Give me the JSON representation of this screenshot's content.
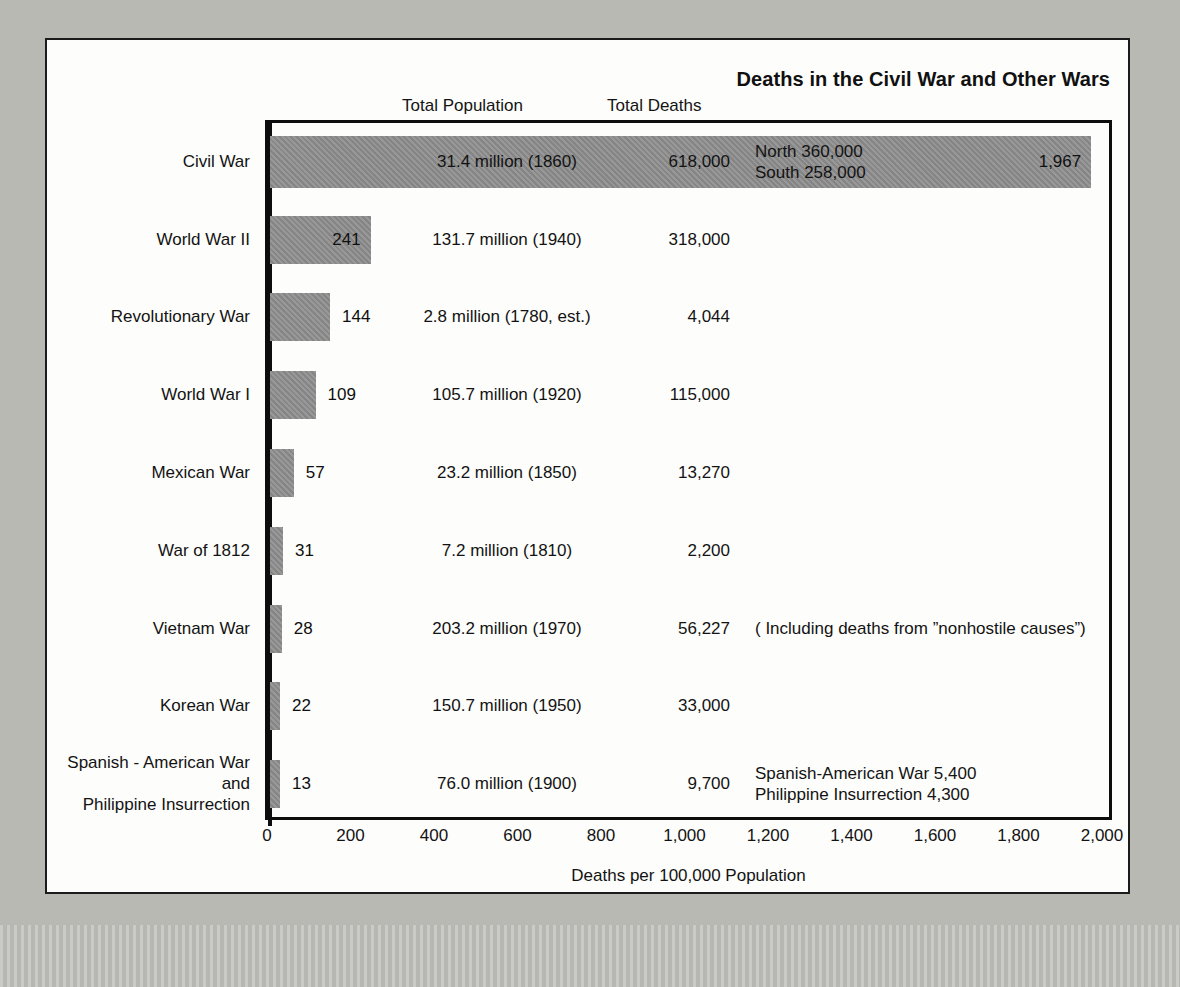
{
  "figure": {
    "title": "Deaths in the Civil War and Other Wars",
    "column_headers": {
      "population": "Total Population",
      "deaths": "Total Deaths"
    },
    "x_axis_title": "Deaths per 100,000 Population"
  },
  "chart_data": {
    "type": "bar",
    "orientation": "horizontal",
    "title": "Deaths in the Civil War and Other Wars",
    "xlabel": "Deaths per 100,000 Population",
    "ylabel": "",
    "xlim": [
      0,
      2000
    ],
    "grid": false,
    "legend": "none",
    "tick_labels": [
      "0",
      "200",
      "400",
      "600",
      "800",
      "1,000",
      "1,200",
      "1,400",
      "1,600",
      "1,800",
      "2,000"
    ],
    "tick_values": [
      0,
      200,
      400,
      600,
      800,
      1000,
      1200,
      1400,
      1600,
      1800,
      2000
    ],
    "categories": [
      "Civil War",
      "World War II",
      "Revolutionary War",
      "World War I",
      "Mexican War",
      "War of 1812",
      "Vietnam War",
      "Korean War",
      "Spanish - American War\nand\nPhilippine Insurrection"
    ],
    "values": [
      1967,
      241,
      144,
      109,
      57,
      31,
      28,
      22,
      13
    ],
    "value_labels": [
      "1,967",
      "241",
      "144",
      "109",
      "57",
      "31",
      "28",
      "22",
      "13"
    ],
    "rows": [
      {
        "category": "Civil War",
        "rate": 1967,
        "rate_label": "1,967",
        "population": "31.4 million (1860)",
        "deaths": "618,000",
        "note": "North 360,000\nSouth 258,000"
      },
      {
        "category": "World War II",
        "rate": 241,
        "rate_label": "241",
        "population": "131.7 million (1940)",
        "deaths": "318,000",
        "note": ""
      },
      {
        "category": "Revolutionary War",
        "rate": 144,
        "rate_label": "144",
        "population": "2.8 million (1780, est.)",
        "deaths": "4,044",
        "note": ""
      },
      {
        "category": "World War I",
        "rate": 109,
        "rate_label": "109",
        "population": "105.7 million (1920)",
        "deaths": "115,000",
        "note": ""
      },
      {
        "category": "Mexican War",
        "rate": 57,
        "rate_label": "57",
        "population": "23.2 million (1850)",
        "deaths": "13,270",
        "note": ""
      },
      {
        "category": "War of 1812",
        "rate": 31,
        "rate_label": "31",
        "population": "7.2 million (1810)",
        "deaths": "2,200",
        "note": ""
      },
      {
        "category": "Vietnam War",
        "rate": 28,
        "rate_label": "28",
        "population": "203.2 million (1970)",
        "deaths": "56,227",
        "note": "( Including deaths from ”nonhostile causes”)"
      },
      {
        "category": "Korean War",
        "rate": 22,
        "rate_label": "22",
        "population": "150.7 million (1950)",
        "deaths": "33,000",
        "note": ""
      },
      {
        "category": "Spanish - American War\nand\nPhilippine Insurrection",
        "rate": 13,
        "rate_label": "13",
        "population": "76.0 million (1900)",
        "deaths": "9,700",
        "note": "Spanish-American War 5,400\nPhilippine Insurrection 4,300"
      }
    ]
  },
  "colors": {
    "bar_fill": "#8c8c8c",
    "frame": "#0d0d0d",
    "paper": "#fdfdfb",
    "page_background": "#b9b9b4",
    "text": "#131313"
  }
}
